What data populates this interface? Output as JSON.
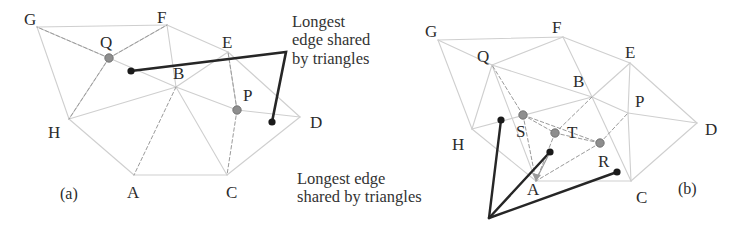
{
  "figure": {
    "panels": [
      {
        "id": "a",
        "caption": "(a)",
        "caption_pos": [
          60,
          185
        ],
        "vertex_labels": [
          {
            "text": "G",
            "x": 24,
            "y": 10
          },
          {
            "text": "F",
            "x": 157,
            "y": 8
          },
          {
            "text": "Q",
            "x": 100,
            "y": 33
          },
          {
            "text": "E",
            "x": 222,
            "y": 33
          },
          {
            "text": "B",
            "x": 173,
            "y": 64
          },
          {
            "text": "P",
            "x": 243,
            "y": 86
          },
          {
            "text": "D",
            "x": 310,
            "y": 113
          },
          {
            "text": "H",
            "x": 48,
            "y": 123
          },
          {
            "text": "A",
            "x": 127,
            "y": 183
          },
          {
            "text": "C",
            "x": 226,
            "y": 183
          }
        ],
        "annotation": {
          "lines": [
            "Longest",
            "edge shared",
            "by triangles"
          ],
          "x": 292,
          "y": 13
        },
        "gray_nodes": [
          {
            "name": "Q",
            "x": 109,
            "y": 58
          },
          {
            "name": "P",
            "x": 237,
            "y": 110
          }
        ],
        "black_nodes": [
          {
            "name": "edge-start",
            "x": 131,
            "y": 71
          },
          {
            "name": "edge-end",
            "x": 272,
            "y": 122
          }
        ],
        "highlight_polyline": [
          [
            131,
            71
          ],
          [
            286,
            52
          ],
          [
            272,
            122
          ]
        ]
      },
      {
        "id": "b",
        "caption": "(b)",
        "caption_pos": [
          678,
          180
        ],
        "vertex_labels": [
          {
            "text": "G",
            "x": 425,
            "y": 22
          },
          {
            "text": "F",
            "x": 552,
            "y": 18
          },
          {
            "text": "Q",
            "x": 477,
            "y": 47
          },
          {
            "text": "E",
            "x": 625,
            "y": 43
          },
          {
            "text": "B",
            "x": 573,
            "y": 72
          },
          {
            "text": "P",
            "x": 635,
            "y": 92
          },
          {
            "text": "D",
            "x": 705,
            "y": 120
          },
          {
            "text": "H",
            "x": 452,
            "y": 135
          },
          {
            "text": "S",
            "x": 516,
            "y": 122
          },
          {
            "text": "T",
            "x": 567,
            "y": 123
          },
          {
            "text": "R",
            "x": 598,
            "y": 152
          },
          {
            "text": "A",
            "x": 527,
            "y": 180
          },
          {
            "text": "C",
            "x": 636,
            "y": 188
          }
        ],
        "annotation": {
          "lines": [
            "Longest edge",
            "shared by triangles"
          ],
          "x": 297,
          "y": 170
        },
        "gray_nodes": [
          {
            "name": "S",
            "x": 523,
            "y": 115
          },
          {
            "name": "T",
            "x": 555,
            "y": 133
          },
          {
            "name": "R",
            "x": 600,
            "y": 143
          }
        ],
        "black_nodes": [
          {
            "name": "fan-node-1",
            "x": 501,
            "y": 120
          },
          {
            "name": "fan-node-2",
            "x": 550,
            "y": 152
          },
          {
            "name": "fan-node-3",
            "x": 617,
            "y": 172
          }
        ],
        "fan_apex": [
          489,
          218
        ]
      }
    ],
    "colors": {
      "mesh_edge": "#cfcfcf",
      "dashed_edge": "#9a9a9a",
      "highlight_edge": "#262626",
      "gray_node_fill": "#8e8e8e",
      "gray_node_stroke": "#6e6e6e",
      "black_node_fill": "#1a1a1a",
      "text": "#2b2b2b",
      "background": "#ffffff"
    },
    "mesh_a": {
      "points": {
        "G": [
          37,
          27
        ],
        "F": [
          167,
          25
        ],
        "E": [
          228,
          52
        ],
        "D": [
          300,
          117
        ],
        "C": [
          227,
          175
        ],
        "A": [
          134,
          175
        ],
        "H": [
          69,
          119
        ],
        "B": [
          176,
          87
        ],
        "Qd": [
          109,
          58
        ],
        "Pd": [
          237,
          110
        ]
      },
      "solid_edges": [
        [
          "G",
          "F"
        ],
        [
          "G",
          "H"
        ],
        [
          "G",
          "Qd"
        ],
        [
          "F",
          "E"
        ],
        [
          "F",
          "B"
        ],
        [
          "E",
          "D"
        ],
        [
          "E",
          "B"
        ],
        [
          "D",
          "C"
        ],
        [
          "D",
          "Pd"
        ],
        [
          "C",
          "A"
        ],
        [
          "C",
          "B"
        ],
        [
          "A",
          "H"
        ],
        [
          "H",
          "B"
        ],
        [
          "H",
          "Qd"
        ],
        [
          "B",
          "Qd"
        ],
        [
          "B",
          "Pd"
        ],
        [
          "F",
          "Qd"
        ],
        [
          "E",
          "Pd"
        ]
      ],
      "dashed_edges": [
        [
          "Qd",
          "F"
        ],
        [
          "Qd",
          "H"
        ],
        [
          "Qd",
          "G"
        ],
        [
          "Pd",
          "E"
        ],
        [
          "Pd",
          "C"
        ],
        [
          "B",
          "A"
        ]
      ]
    },
    "mesh_b": {
      "points": {
        "G": [
          438,
          40
        ],
        "F": [
          563,
          37
        ],
        "E": [
          630,
          63
        ],
        "D": [
          697,
          123
        ],
        "C": [
          631,
          181
        ],
        "A": [
          536,
          181
        ],
        "H": [
          472,
          129
        ],
        "B": [
          592,
          97
        ],
        "Q": [
          492,
          65
        ],
        "P": [
          628,
          113
        ],
        "S": [
          523,
          115
        ],
        "T": [
          555,
          133
        ],
        "R": [
          600,
          143
        ]
      },
      "solid_edges": [
        [
          "G",
          "F"
        ],
        [
          "G",
          "H"
        ],
        [
          "G",
          "Q"
        ],
        [
          "F",
          "E"
        ],
        [
          "F",
          "B"
        ],
        [
          "F",
          "Q"
        ],
        [
          "E",
          "D"
        ],
        [
          "E",
          "B"
        ],
        [
          "E",
          "P"
        ],
        [
          "D",
          "C"
        ],
        [
          "D",
          "P"
        ],
        [
          "C",
          "A"
        ],
        [
          "C",
          "P"
        ],
        [
          "C",
          "B"
        ],
        [
          "A",
          "H"
        ],
        [
          "H",
          "Q"
        ],
        [
          "H",
          "B"
        ],
        [
          "Q",
          "B"
        ],
        [
          "B",
          "P"
        ],
        [
          "Q",
          "A"
        ]
      ],
      "dashed_edges": [
        [
          "S",
          "Q"
        ],
        [
          "S",
          "A"
        ],
        [
          "S",
          "T"
        ],
        [
          "T",
          "B"
        ],
        [
          "T",
          "R"
        ],
        [
          "T",
          "A"
        ],
        [
          "R",
          "P"
        ],
        [
          "R",
          "A"
        ],
        [
          "R",
          "S"
        ]
      ]
    }
  }
}
